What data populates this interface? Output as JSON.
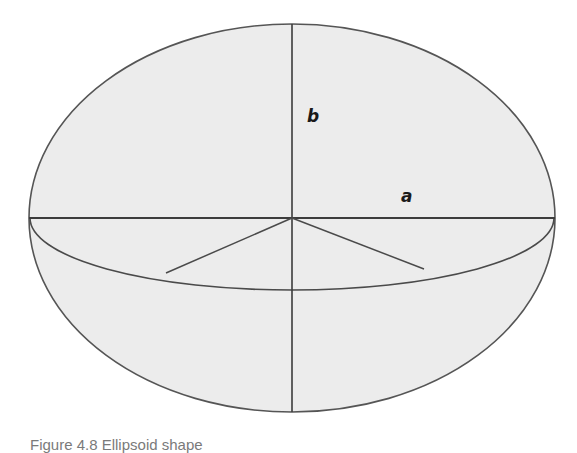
{
  "figure": {
    "labels": {
      "semi_major_axis": "a",
      "semi_minor_axis": "b"
    },
    "caption": "Figure 4.8 Ellipsoid shape",
    "caption_visibility": "clipped at bottom edge; only tops of glyphs visible",
    "colors": {
      "fill": "#ececec",
      "stroke": "#3c3c3c",
      "outline": "#555555"
    },
    "geometry": {
      "ellipse": {
        "cx": 292,
        "cy": 218,
        "rx": 263,
        "ry": 194
      },
      "equator_arc": {
        "cx": 292,
        "cy": 218,
        "rx": 262,
        "ry": 72
      },
      "horizontal_axis": {
        "x1": 29,
        "y1": 218,
        "x2": 555,
        "y2": 218
      },
      "vertical_axis": {
        "x1": 292,
        "y1": 24,
        "x2": 292,
        "y2": 412
      },
      "left_radius": {
        "x1": 292,
        "y1": 218,
        "x2": 166,
        "y2": 273
      },
      "right_radius": {
        "x1": 292,
        "y1": 218,
        "x2": 424,
        "y2": 269
      }
    }
  }
}
